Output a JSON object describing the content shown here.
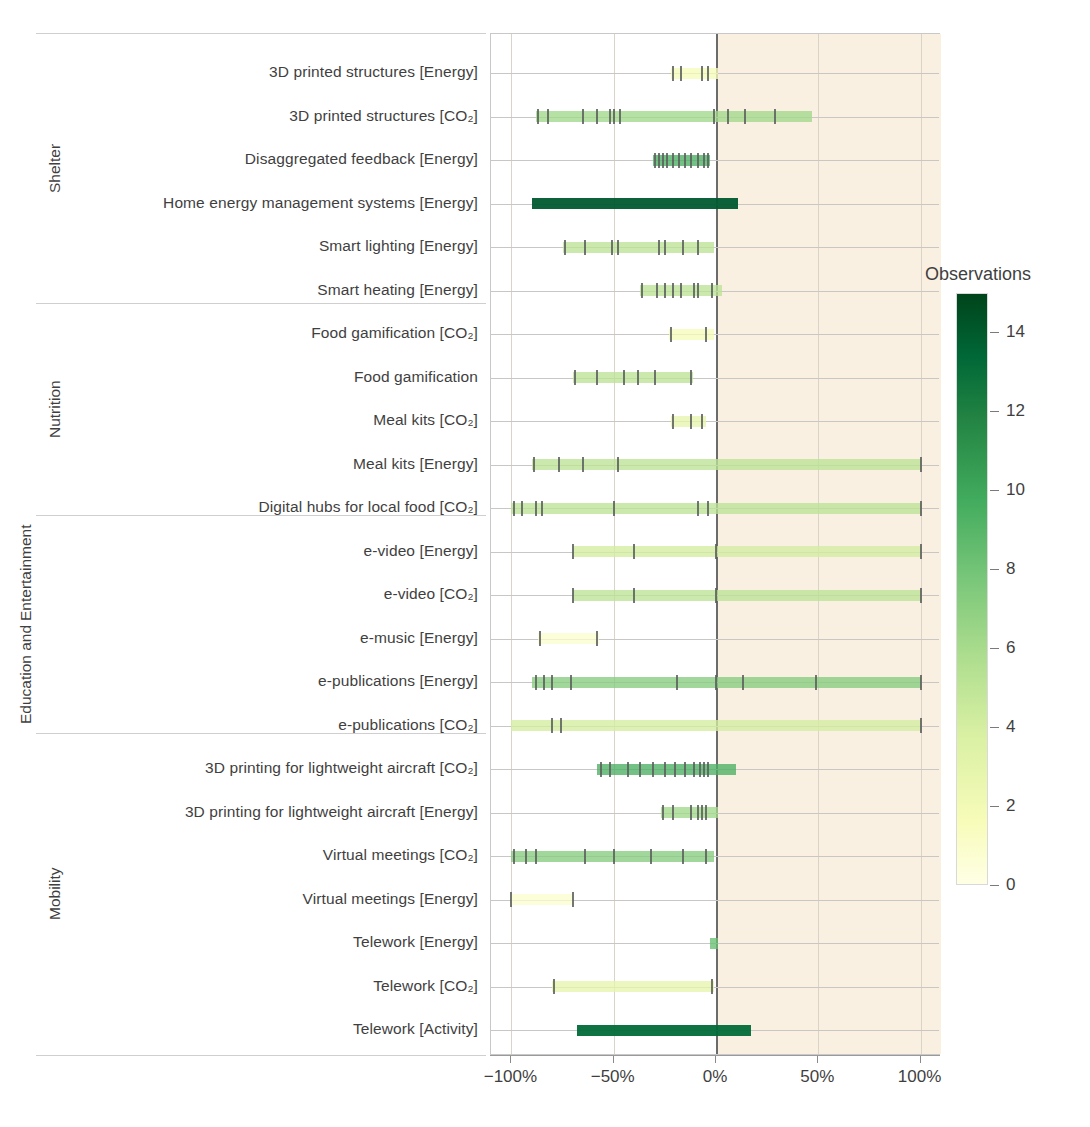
{
  "chart_data": {
    "type": "bar",
    "title": "",
    "xlabel": "",
    "ylabel": "",
    "xlim": [
      -110,
      110
    ],
    "xticks": [
      -100,
      -50,
      0,
      50,
      100
    ],
    "xticklabels": [
      "−100%",
      "−50%",
      "0%",
      "50%",
      "100%"
    ],
    "grid": true,
    "legend_position": "right",
    "colorbar": {
      "title": "Observations",
      "min": 0,
      "max": 15,
      "ticks": [
        0,
        2,
        4,
        6,
        8,
        10,
        12,
        14
      ],
      "ticklabels": [
        "0",
        "2",
        "4",
        "6",
        "8",
        "10",
        "12",
        "14"
      ],
      "colormap": "YlGn"
    },
    "groups": [
      {
        "name": "Shelter",
        "rows": [
          0,
          5
        ]
      },
      {
        "name": "Nutrition",
        "rows": [
          6,
          10
        ]
      },
      {
        "name": "Education and\nEntertainment",
        "rows": [
          11,
          15
        ]
      },
      {
        "name": "Mobility",
        "rows": [
          16,
          22
        ]
      }
    ],
    "categories": [
      "3D printed structures [Energy]",
      "3D printed structures [CO₂]",
      "Disaggregated feedback [Energy]",
      "Home energy management systems [Energy]",
      "Smart lighting [Energy]",
      "Smart heating [Energy]",
      "Food gamification [CO₂]",
      "Food gamification",
      "Meal kits [CO₂]",
      "Meal kits [Energy]",
      "Digital hubs for local food [CO₂]",
      "e-video [Energy]",
      "e-video [CO₂]",
      "e-music [Energy]",
      "e-publications [Energy]",
      "e-publications [CO₂]",
      "3D printing for lightweight aircraft [CO₂]",
      "3D printing for lightweight aircraft [Energy]",
      "Virtual meetings [CO₂]",
      "Virtual meetings [Energy]",
      "Telework [Energy]",
      "Telework [CO₂]",
      "Telework [Activity]"
    ],
    "rows": [
      {
        "label": "3D printed structures [Energy]",
        "group": "Shelter",
        "range": [
          -22,
          1
        ],
        "density": 2,
        "observations": [
          -21,
          -17,
          -7,
          -4
        ]
      },
      {
        "label": "3D printed structures [CO₂]",
        "group": "Shelter",
        "range": [
          -88,
          47
        ],
        "density": 6,
        "observations": [
          -87,
          -82,
          -65,
          -58,
          -52,
          -50,
          -47,
          -1,
          6,
          14,
          29
        ]
      },
      {
        "label": "Disaggregated feedback [Energy]",
        "group": "Shelter",
        "range": [
          -31,
          -3
        ],
        "density": 9,
        "observations": [
          -30,
          -28,
          -26,
          -24,
          -21,
          -18,
          -15,
          -12,
          -9,
          -6,
          -4
        ]
      },
      {
        "label": "Home energy management systems [Energy]",
        "group": "Shelter",
        "range": [
          -90,
          11
        ],
        "density": 14,
        "observations": []
      },
      {
        "label": "Smart lighting [Energy]",
        "group": "Shelter",
        "range": [
          -75,
          -1
        ],
        "density": 5,
        "observations": [
          -74,
          -64,
          -51,
          -48,
          -28,
          -25,
          -16,
          -9
        ]
      },
      {
        "label": "Smart heating [Energy]",
        "group": "Shelter",
        "range": [
          -37,
          3
        ],
        "density": 5,
        "observations": [
          -36,
          -29,
          -25,
          -21,
          -17,
          -11,
          -9,
          -2
        ]
      },
      {
        "label": "Food gamification [CO₂]",
        "group": "Nutrition",
        "range": [
          -23,
          -1
        ],
        "density": 2,
        "observations": [
          -22,
          -5
        ]
      },
      {
        "label": "Food gamification",
        "group": "Nutrition",
        "range": [
          -70,
          -11
        ],
        "density": 5,
        "observations": [
          -69,
          -58,
          -45,
          -38,
          -30,
          -12
        ]
      },
      {
        "label": "Meal kits [CO₂]",
        "group": "Nutrition",
        "range": [
          -22,
          -5
        ],
        "density": 3,
        "observations": [
          -21,
          -12,
          -7
        ]
      },
      {
        "label": "Meal kits [Energy]",
        "group": "Nutrition",
        "range": [
          -90,
          100
        ],
        "density": 5,
        "observations": [
          -89,
          -77,
          -65,
          -48,
          100
        ]
      },
      {
        "label": "Digital hubs for local food [CO₂]",
        "group": "Nutrition",
        "range": [
          -100,
          100
        ],
        "density": 5,
        "observations": [
          -99,
          -95,
          -88,
          -85,
          -50,
          -9,
          -4,
          100
        ]
      },
      {
        "label": "e-video [Energy]",
        "group": "Education and Entertainment",
        "range": [
          -70,
          100
        ],
        "density": 4,
        "observations": [
          -70,
          -40,
          0,
          100
        ]
      },
      {
        "label": "e-video [CO₂]",
        "group": "Education and Entertainment",
        "range": [
          -70,
          100
        ],
        "density": 5,
        "observations": [
          -70,
          -40,
          0,
          100
        ]
      },
      {
        "label": "e-music [Energy]",
        "group": "Education and Entertainment",
        "range": [
          -87,
          -57
        ],
        "density": 1,
        "observations": [
          -86,
          -58
        ]
      },
      {
        "label": "e-publications [Energy]",
        "group": "Education and Entertainment",
        "range": [
          -90,
          100
        ],
        "density": 7,
        "observations": [
          -88,
          -84,
          -80,
          -71,
          -19,
          0,
          13,
          49,
          100
        ]
      },
      {
        "label": "e-publications [CO₂]",
        "group": "Education and Entertainment",
        "range": [
          -100,
          100
        ],
        "density": 4,
        "observations": [
          -80,
          -76,
          100
        ]
      },
      {
        "label": "3D printing for lightweight aircraft [CO₂]",
        "group": "Mobility",
        "range": [
          -58,
          10
        ],
        "density": 9,
        "observations": [
          -56,
          -52,
          -43,
          -37,
          -31,
          -25,
          -20,
          -15,
          -11,
          -8,
          -6,
          -4
        ]
      },
      {
        "label": "3D printing for lightweight aircraft [Energy]",
        "group": "Mobility",
        "range": [
          -27,
          1
        ],
        "density": 6,
        "observations": [
          -26,
          -21,
          -12,
          -9,
          -7,
          -5
        ]
      },
      {
        "label": "Virtual meetings [CO₂]",
        "group": "Mobility",
        "range": [
          -100,
          -1
        ],
        "density": 7,
        "observations": [
          -99,
          -93,
          -88,
          -64,
          -50,
          -32,
          -16,
          -5
        ]
      },
      {
        "label": "Virtual meetings [Energy]",
        "group": "Mobility",
        "range": [
          -100,
          -70
        ],
        "density": 1,
        "observations": [
          -100,
          -70
        ]
      },
      {
        "label": "Telework [Energy]",
        "group": "Mobility",
        "range": [
          -3,
          1
        ],
        "density": 8,
        "observations": []
      },
      {
        "label": "Telework [CO₂]",
        "group": "Mobility",
        "range": [
          -80,
          -1
        ],
        "density": 3,
        "observations": [
          -79,
          -2
        ]
      },
      {
        "label": "Telework [Activity]",
        "group": "Mobility",
        "range": [
          -68,
          17
        ],
        "density": 13,
        "observations": []
      }
    ]
  },
  "colors": {
    "positive_region_bg": "#faf0e1",
    "negative_region_bg": "#ffffff",
    "zero_line": "#6b6b6b",
    "grid": "#c9c7c4",
    "tick_mark": "#5a5f5c",
    "text": "#3f3f3f"
  }
}
